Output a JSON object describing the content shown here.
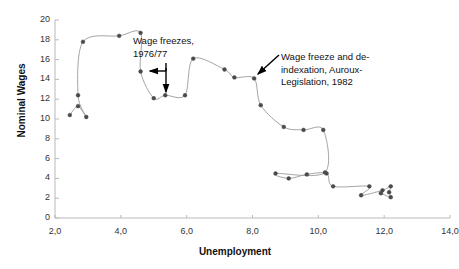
{
  "chart_data": {
    "type": "scatter",
    "title": "",
    "xlabel": "Unemployment",
    "ylabel": "Nominal Wages",
    "xlim": [
      2.0,
      14.0
    ],
    "ylim": [
      0,
      20
    ],
    "grid": false,
    "legend": null,
    "marker_style": "small-dot",
    "line_style": "thin-connected",
    "x_ticks": [
      "2,0",
      "4,0",
      "6,0",
      "8,0",
      "10,0",
      "12,0",
      "14,0"
    ],
    "x_tick_values": [
      2.0,
      4.0,
      6.0,
      8.0,
      10.0,
      12.0,
      14.0
    ],
    "y_ticks": [
      "0",
      "2",
      "4",
      "6",
      "8",
      "10",
      "12",
      "14",
      "16",
      "18",
      "20"
    ],
    "y_tick_values": [
      0,
      2,
      4,
      6,
      8,
      10,
      12,
      14,
      16,
      18,
      20
    ],
    "series": [
      {
        "name": "Nominal wage growth vs unemployment",
        "points": [
          {
            "x": 2.45,
            "y": 10.4
          },
          {
            "x": 2.7,
            "y": 11.3
          },
          {
            "x": 2.95,
            "y": 10.2
          },
          {
            "x": 2.7,
            "y": 12.4
          },
          {
            "x": 2.85,
            "y": 17.8
          },
          {
            "x": 3.95,
            "y": 18.4
          },
          {
            "x": 4.6,
            "y": 18.7
          },
          {
            "x": 4.6,
            "y": 14.8
          },
          {
            "x": 5.0,
            "y": 12.1
          },
          {
            "x": 5.35,
            "y": 12.4
          },
          {
            "x": 5.95,
            "y": 12.4
          },
          {
            "x": 6.2,
            "y": 16.1
          },
          {
            "x": 7.15,
            "y": 15.0
          },
          {
            "x": 7.45,
            "y": 14.2
          },
          {
            "x": 8.05,
            "y": 14.1
          },
          {
            "x": 8.25,
            "y": 11.4
          },
          {
            "x": 8.95,
            "y": 9.2
          },
          {
            "x": 9.55,
            "y": 8.9
          },
          {
            "x": 10.15,
            "y": 8.9
          },
          {
            "x": 10.2,
            "y": 4.6
          },
          {
            "x": 8.7,
            "y": 4.5
          },
          {
            "x": 9.1,
            "y": 4.0
          },
          {
            "x": 9.65,
            "y": 4.4
          },
          {
            "x": 10.25,
            "y": 4.5
          },
          {
            "x": 10.45,
            "y": 3.2
          },
          {
            "x": 11.55,
            "y": 3.2
          },
          {
            "x": 11.3,
            "y": 2.3
          },
          {
            "x": 11.95,
            "y": 2.8
          },
          {
            "x": 12.2,
            "y": 3.2
          },
          {
            "x": 12.15,
            "y": 2.6
          },
          {
            "x": 12.2,
            "y": 2.1
          },
          {
            "x": 11.9,
            "y": 2.5
          }
        ]
      }
    ],
    "annotations": [
      {
        "id": "wage-freezes",
        "text": "Wage freezes,\n1976/77",
        "target_x": 5.0,
        "target_y": 12.1,
        "arrows": 2
      },
      {
        "id": "auroux",
        "text": "Wage freeze and de-\nindexation, Auroux-\nLegislation, 1982",
        "target_x": 8.05,
        "target_y": 14.1,
        "arrows": 1
      }
    ]
  },
  "axes": {
    "y_title": "Nominal Wages",
    "x_title": "Unemployment"
  },
  "colors": {
    "line": "#9a9a9a",
    "marker": "#4a4a4a",
    "axis": "#b9b9b9",
    "text": "#333333",
    "annotation": "#111111",
    "background": "#ffffff"
  }
}
